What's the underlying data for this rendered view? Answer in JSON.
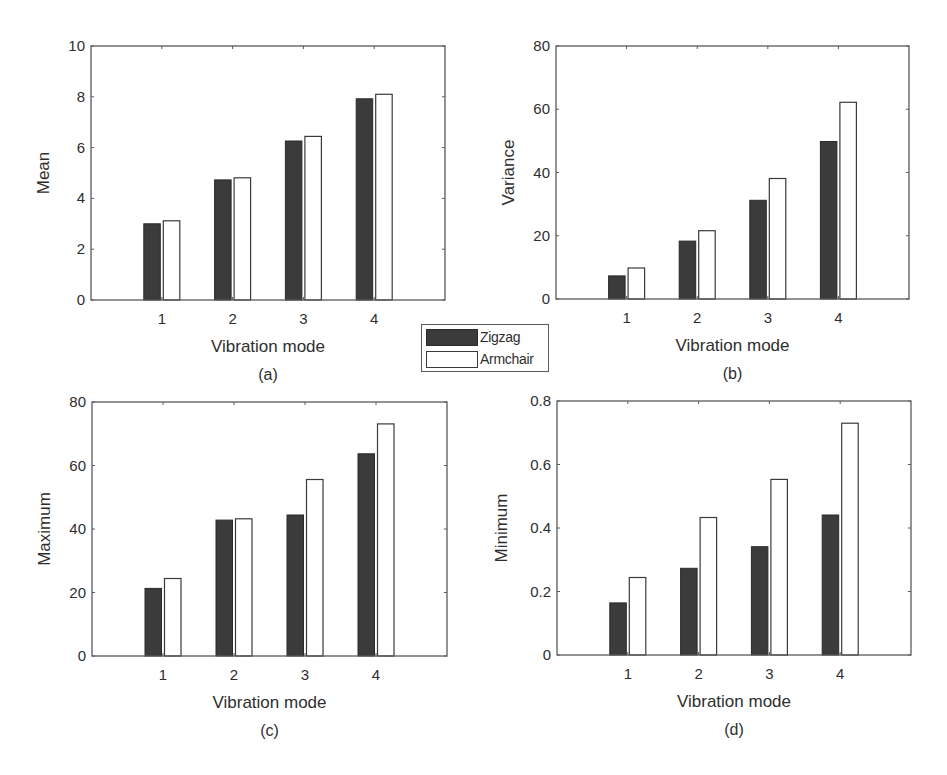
{
  "legend": {
    "items": [
      {
        "label": "Zigzag",
        "color": "#3b3b3b"
      },
      {
        "label": "Armchair",
        "color": "#ffffff"
      }
    ]
  },
  "chart_data": [
    {
      "type": "bar",
      "panel": "(a)",
      "categories": [
        "1",
        "2",
        "3",
        "4"
      ],
      "xlabel": "Vibration mode",
      "ylabel": "Mean",
      "ylim": [
        0,
        10
      ],
      "yticks": [
        "0",
        "2",
        "4",
        "6",
        "8",
        "10"
      ],
      "grid": false,
      "series": [
        {
          "name": "Zigzag",
          "values": [
            3.0,
            4.73,
            6.26,
            7.92
          ]
        },
        {
          "name": "Armchair",
          "values": [
            3.12,
            4.81,
            6.44,
            8.1
          ]
        }
      ]
    },
    {
      "type": "bar",
      "panel": "(b)",
      "categories": [
        "1",
        "2",
        "3",
        "4"
      ],
      "xlabel": "Vibration mode",
      "ylabel": "Variance",
      "ylim": [
        0,
        80
      ],
      "yticks": [
        "0",
        "20",
        "40",
        "60",
        "80"
      ],
      "grid": false,
      "series": [
        {
          "name": "Zigzag",
          "values": [
            7.3,
            18.3,
            31.2,
            49.8
          ]
        },
        {
          "name": "Armchair",
          "values": [
            9.8,
            21.6,
            38.1,
            62.2
          ]
        }
      ]
    },
    {
      "type": "bar",
      "panel": "(c)",
      "categories": [
        "1",
        "2",
        "3",
        "4"
      ],
      "xlabel": "Vibration mode",
      "ylabel": "Maximum",
      "ylim": [
        0,
        80
      ],
      "yticks": [
        "0",
        "20",
        "40",
        "60",
        "80"
      ],
      "grid": false,
      "series": [
        {
          "name": "Zigzag",
          "values": [
            21.3,
            42.8,
            44.4,
            63.7
          ]
        },
        {
          "name": "Armchair",
          "values": [
            24.4,
            43.2,
            55.6,
            73.1
          ]
        }
      ]
    },
    {
      "type": "bar",
      "panel": "(d)",
      "categories": [
        "1",
        "2",
        "3",
        "4"
      ],
      "xlabel": "Vibration mode",
      "ylabel": "Minimum",
      "ylim": [
        0,
        0.8
      ],
      "yticks": [
        "0",
        "0.2",
        "0.4",
        "0.6",
        "0.8"
      ],
      "grid": false,
      "series": [
        {
          "name": "Zigzag",
          "values": [
            0.164,
            0.273,
            0.341,
            0.441
          ]
        },
        {
          "name": "Armchair",
          "values": [
            0.244,
            0.433,
            0.553,
            0.73
          ]
        }
      ]
    }
  ]
}
